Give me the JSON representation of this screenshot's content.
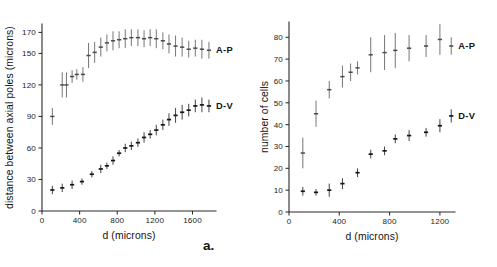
{
  "figure": {
    "panels": [
      {
        "letter": "a.",
        "ylabel": "distance between axial poles (microns)",
        "xlabel": "d (microns)",
        "yticks": [
          0,
          30,
          60,
          90,
          120,
          150,
          170
        ],
        "xticks": [
          0,
          400,
          800,
          1200,
          1600
        ],
        "series_labels": [
          "A-P",
          "D-V"
        ]
      },
      {
        "letter": "b.",
        "ylabel": "number of cells",
        "xlabel": "d (microns)",
        "yticks": [
          0,
          10,
          20,
          30,
          40,
          50,
          60,
          70,
          80
        ],
        "xticks": [
          0,
          400,
          800,
          1200
        ],
        "series_labels": [
          "A-P",
          "D-V"
        ]
      }
    ]
  },
  "chart_data": [
    {
      "type": "scatter",
      "title": "",
      "panel": "a",
      "xlabel": "d (microns)",
      "ylabel": "distance between axial poles (microns)",
      "xlim": [
        0,
        1850
      ],
      "ylim": [
        0,
        178
      ],
      "xticks": [
        0,
        400,
        800,
        1200,
        1600
      ],
      "yticks": [
        0,
        30,
        60,
        90,
        120,
        150,
        170
      ],
      "grid": false,
      "legend_position": "right-inline",
      "series": [
        {
          "name": "A-P",
          "x": [
            110,
            215,
            260,
            320,
            370,
            435,
            495,
            560,
            625,
            690,
            755,
            820,
            885,
            950,
            1020,
            1085,
            1150,
            1215,
            1285,
            1350,
            1420,
            1490,
            1560,
            1630,
            1700,
            1775
          ],
          "y": [
            90,
            120,
            120,
            128,
            130,
            130,
            148,
            151,
            156,
            160,
            162,
            163,
            164,
            165,
            165,
            164,
            165,
            164,
            162,
            159,
            157,
            156,
            154,
            155,
            154,
            153
          ],
          "yerr": [
            8,
            12,
            12,
            6,
            5,
            7,
            12,
            10,
            9,
            8,
            9,
            8,
            9,
            8,
            8,
            8,
            8,
            9,
            8,
            9,
            10,
            9,
            8,
            8,
            9,
            8
          ]
        },
        {
          "name": "D-V",
          "x": [
            110,
            215,
            320,
            425,
            530,
            625,
            690,
            755,
            820,
            885,
            950,
            1020,
            1085,
            1150,
            1215,
            1285,
            1350,
            1420,
            1490,
            1560,
            1630,
            1700,
            1775
          ],
          "y": [
            20,
            22,
            25,
            28,
            35,
            40,
            43,
            48,
            55,
            60,
            62,
            65,
            70,
            73,
            77,
            82,
            87,
            91,
            94,
            96,
            100,
            101,
            100
          ],
          "yerr": [
            4,
            4,
            4,
            3,
            3,
            4,
            3,
            4,
            3,
            4,
            4,
            4,
            5,
            4,
            5,
            5,
            6,
            7,
            7,
            6,
            6,
            7,
            6
          ]
        }
      ]
    },
    {
      "type": "scatter",
      "title": "",
      "panel": "b",
      "xlabel": "d (microns)",
      "ylabel": "number of cells",
      "xlim": [
        0,
        1320
      ],
      "ylim": [
        0,
        87
      ],
      "xticks": [
        0,
        400,
        800,
        1200
      ],
      "yticks": [
        0,
        10,
        20,
        30,
        40,
        50,
        60,
        70,
        80
      ],
      "grid": false,
      "legend_position": "right-inline",
      "series": [
        {
          "name": "A-P",
          "x": [
            110,
            215,
            320,
            425,
            490,
            545,
            650,
            760,
            845,
            955,
            1090,
            1200,
            1290
          ],
          "y": [
            27,
            45,
            56,
            62,
            64,
            66,
            72,
            73,
            74,
            75,
            76,
            79,
            76
          ],
          "yerr": [
            7,
            6,
            4,
            5,
            4,
            3,
            8,
            8,
            8,
            6,
            5,
            7,
            4
          ]
        },
        {
          "name": "D-V",
          "x": [
            110,
            215,
            320,
            425,
            545,
            650,
            760,
            845,
            955,
            1090,
            1200,
            1290
          ],
          "y": [
            9.5,
            9,
            10,
            13,
            18,
            26.5,
            28,
            33.5,
            35,
            36.5,
            39.5,
            44
          ],
          "yerr": [
            2,
            1.5,
            3,
            2.5,
            2,
            2,
            2,
            2,
            2.5,
            2,
            3,
            3
          ]
        }
      ]
    }
  ]
}
